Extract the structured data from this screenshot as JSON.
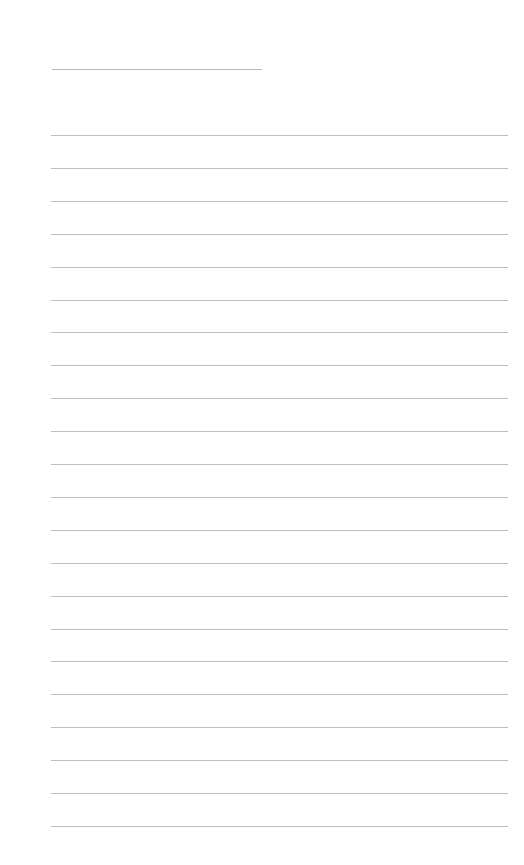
{
  "page": {
    "type": "blank lined paper",
    "title_line": {
      "label": ""
    },
    "rules": {
      "count": 22,
      "first_y": 135,
      "spacing": 32.9,
      "color": "#bdbdbd"
    },
    "lines": [
      "",
      "",
      "",
      "",
      "",
      "",
      "",
      "",
      "",
      "",
      "",
      "",
      "",
      "",
      "",
      "",
      "",
      "",
      "",
      "",
      "",
      ""
    ]
  }
}
